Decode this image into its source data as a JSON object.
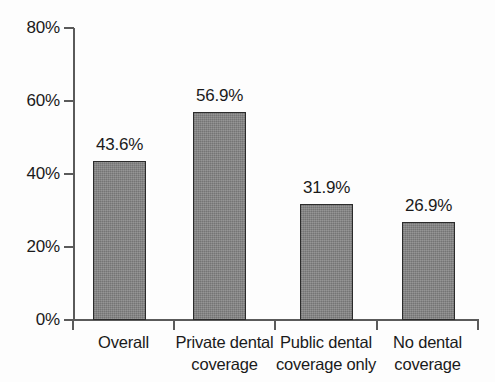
{
  "chart_data": {
    "type": "bar",
    "title": "",
    "subtitle": "",
    "xlabel": "",
    "ylabel": "",
    "ylim": [
      0,
      80
    ],
    "grid": false,
    "legend": "none",
    "categories": [
      "Overall",
      "Private dental coverage",
      "Public dental coverage only",
      "No dental coverage"
    ],
    "category_lines": [
      [
        "Overall"
      ],
      [
        "Private dental",
        "coverage"
      ],
      [
        "Public dental",
        "coverage only"
      ],
      [
        "No dental",
        "coverage"
      ]
    ],
    "values": [
      43.6,
      56.9,
      31.9,
      26.9
    ],
    "data_labels": [
      "43.6%",
      "56.9%",
      "31.9%",
      "26.9%"
    ],
    "y_ticks": [
      0,
      20,
      40,
      60,
      80
    ],
    "y_tick_labels": [
      "0%",
      "20%",
      "40%",
      "60%",
      "80%"
    ],
    "bar_fill_color": "#828282",
    "bar_border_color": "#2b2b2b",
    "axis_color": "#5a5a5a",
    "text_color": "#1a1a1a",
    "background_color": "#fdfdfd"
  }
}
